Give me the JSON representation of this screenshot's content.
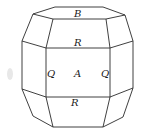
{
  "figure": {
    "type": "crystal-habit-drawing",
    "faces": [
      {
        "label": "B",
        "position": "top"
      },
      {
        "label": "R",
        "position": "upper-front"
      },
      {
        "label": "Q",
        "position": "front-left-edge"
      },
      {
        "label": "A",
        "position": "front-center"
      },
      {
        "label": "Q",
        "position": "front-right-edge"
      },
      {
        "label": "R",
        "position": "lower-front"
      }
    ],
    "colors": {
      "line": "#2a2a2a",
      "background": "#ffffff"
    }
  }
}
